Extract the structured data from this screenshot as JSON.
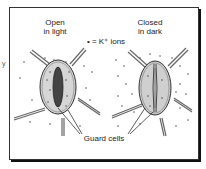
{
  "diagram": {
    "left_panel": {
      "label_line1": "Open",
      "label_line2": "in light"
    },
    "right_panel": {
      "label_line1": "Closed",
      "label_line2": "in dark"
    },
    "legend": {
      "symbol": "•",
      "text": "= K⁺ ions"
    },
    "pointer_label": "Guard cells",
    "edge_fragment": "y"
  },
  "colors": {
    "stroke": "#333333",
    "guard_fill": "#d4d4d4",
    "pore_fill": "#444444",
    "dot": "#555555"
  }
}
